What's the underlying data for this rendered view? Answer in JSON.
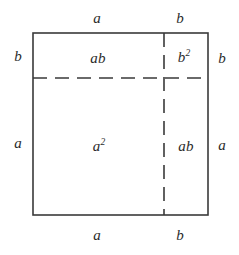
{
  "figure": {
    "stroke_color": "#3a3a3a",
    "background_color": "#ffffff",
    "text_color": "#2b2b2b"
  },
  "geometry": {
    "square": {
      "x": 33,
      "y": 33,
      "width": 175,
      "height": 182
    },
    "divider_horizontal_y": 78,
    "divider_vertical_x": 164,
    "dash_pattern": "14 8",
    "outer_stroke_width": 1.6,
    "dash_stroke_width": 1.6
  },
  "edge_labels": {
    "top": [
      {
        "text": "a",
        "x": 97,
        "y": 18
      },
      {
        "text": "b",
        "x": 180,
        "y": 18
      }
    ],
    "bottom": [
      {
        "text": "a",
        "x": 97,
        "y": 235
      },
      {
        "text": "b",
        "x": 180,
        "y": 235
      }
    ],
    "left": [
      {
        "text": "b",
        "x": 18,
        "y": 56
      },
      {
        "text": "a",
        "x": 18,
        "y": 143
      }
    ],
    "right": [
      {
        "text": "b",
        "x": 222,
        "y": 58
      },
      {
        "text": "a",
        "x": 222,
        "y": 145
      }
    ]
  },
  "regions": [
    {
      "name": "top-left",
      "base": "ab",
      "exponent": "",
      "x": 98,
      "y": 58
    },
    {
      "name": "top-right",
      "base": "b",
      "exponent": "2",
      "x": 184,
      "y": 57
    },
    {
      "name": "bottom-left",
      "base": "a",
      "exponent": "2",
      "x": 99,
      "y": 146
    },
    {
      "name": "bottom-right",
      "base": "ab",
      "exponent": "",
      "x": 186,
      "y": 146
    }
  ]
}
